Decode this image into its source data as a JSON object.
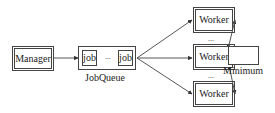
{
  "diagram": {
    "manager": {
      "label": "Manager"
    },
    "job_queue": {
      "label": "JobQueue",
      "items": [
        "job",
        "job"
      ],
      "ellipsis": "..."
    },
    "workers": [
      {
        "label": "Worker"
      },
      {
        "label": "Worker"
      },
      {
        "label": "Worker"
      }
    ],
    "worker_ellipses": [
      "...",
      "..."
    ],
    "minimum": {
      "label": "Minimum"
    },
    "colors": {
      "stroke": "#444444",
      "text": "#222222",
      "background": "#ffffff"
    }
  }
}
